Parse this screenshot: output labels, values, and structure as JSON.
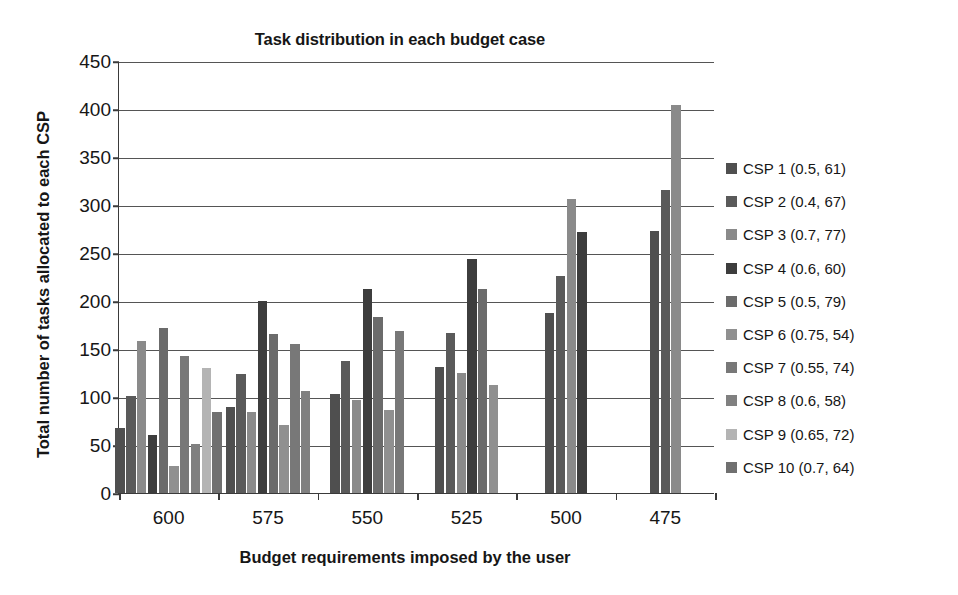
{
  "chart_data": {
    "type": "bar",
    "title": "Task distribution in each budget case",
    "xlabel": "Budget requirements imposed by the user",
    "ylabel": "Total number of tasks allocated to each CSP",
    "categories": [
      "600",
      "575",
      "550",
      "525",
      "500",
      "475"
    ],
    "ylim": [
      0,
      450
    ],
    "yticks": [
      0,
      50,
      100,
      150,
      200,
      250,
      300,
      350,
      400,
      450
    ],
    "grid": true,
    "legend_position": "right",
    "series": [
      {
        "name": "CSP 1 (0.5, 61)",
        "color": "#4f4f4f",
        "values": [
          68,
          90,
          103,
          131,
          187,
          273
        ]
      },
      {
        "name": "CSP 2 (0.4, 67)",
        "color": "#5a5a5a",
        "values": [
          101,
          124,
          138,
          167,
          226,
          316
        ]
      },
      {
        "name": "CSP 3 (0.7, 77)",
        "color": "#8a8a8a",
        "values": [
          158,
          84,
          97,
          125,
          306,
          404
        ]
      },
      {
        "name": "CSP 4 (0.6, 60)",
        "color": "#3d3d3d",
        "values": [
          60,
          200,
          213,
          244,
          272,
          null
        ]
      },
      {
        "name": "CSP 5 (0.5, 79)",
        "color": "#6b6b6b",
        "values": [
          172,
          166,
          183,
          212,
          null,
          null
        ]
      },
      {
        "name": "CSP 6 (0.75, 54)",
        "color": "#909090",
        "values": [
          28,
          71,
          86,
          112,
          null,
          null
        ]
      },
      {
        "name": "CSP 7 (0.55, 74)",
        "color": "#787878",
        "values": [
          143,
          155,
          169,
          null,
          null,
          null
        ]
      },
      {
        "name": "CSP 8 (0.6, 58)",
        "color": "#808080",
        "values": [
          51,
          106,
          null,
          null,
          null,
          null
        ]
      },
      {
        "name": "CSP 9 (0.65, 72)",
        "color": "#b4b4b4",
        "values": [
          130,
          null,
          null,
          null,
          null,
          null
        ]
      },
      {
        "name": "CSP 10 (0.7, 64)",
        "color": "#707070",
        "values": [
          84,
          null,
          null,
          null,
          null,
          null
        ]
      }
    ]
  },
  "legend": {
    "items": [
      {
        "label": "CSP 1 (0.5, 61)",
        "color": "#4f4f4f"
      },
      {
        "label": "CSP 2 (0.4, 67)",
        "color": "#5a5a5a"
      },
      {
        "label": "CSP 3 (0.7, 77)",
        "color": "#8a8a8a"
      },
      {
        "label": "CSP 4 (0.6, 60)",
        "color": "#3d3d3d"
      },
      {
        "label": "CSP 5 (0.5, 79)",
        "color": "#6b6b6b"
      },
      {
        "label": "CSP 6 (0.75, 54)",
        "color": "#909090"
      },
      {
        "label": "CSP 7 (0.55, 74)",
        "color": "#787878"
      },
      {
        "label": "CSP 8 (0.6, 58)",
        "color": "#808080"
      },
      {
        "label": "CSP 9 (0.65, 72)",
        "color": "#b4b4b4"
      },
      {
        "label": "CSP 10 (0.7, 64)",
        "color": "#707070"
      }
    ]
  }
}
